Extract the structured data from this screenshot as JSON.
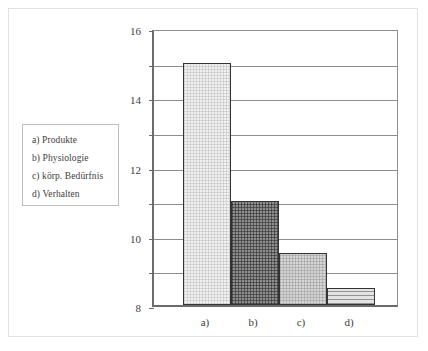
{
  "chart_data": {
    "type": "bar",
    "title": "",
    "xlabel": "",
    "ylabel": "",
    "categories": [
      "a)",
      "b)",
      "c)",
      "d)"
    ],
    "values": [
      14,
      6,
      3,
      1
    ],
    "ylim": [
      0,
      16
    ],
    "ytick_labels": [
      "0",
      "2",
      "4",
      "6",
      "8",
      "10",
      "12",
      "14",
      "16"
    ],
    "ytick_values": [
      0,
      2,
      4,
      6,
      8,
      10,
      12,
      14,
      16
    ],
    "grid": "horizontal",
    "legend_position": "left-outside",
    "series": [
      {
        "name": "Nennungen",
        "values": [
          14,
          6,
          3,
          1
        ]
      }
    ],
    "bar_fills": [
      "light-grid",
      "dark-grid",
      "medium-grid",
      "horizontal-lines"
    ]
  },
  "legend": {
    "items": [
      {
        "label": "a) Produkte"
      },
      {
        "label": "b) Physiologie"
      },
      {
        "label": "c)  körp. Bedürfnis"
      },
      {
        "label": "d) Verhalten"
      }
    ]
  },
  "colors": {
    "axis": "#6b6b6b",
    "gridline": "#8d8d8d",
    "bar_outline": "#333333",
    "text": "#3d3d3d",
    "frame": "#e2e2e2",
    "bar_a": "#f0f0f0",
    "bar_b": "#8e8e8e",
    "bar_c": "#d6d6d6",
    "bar_d": "#e3e3e3"
  }
}
